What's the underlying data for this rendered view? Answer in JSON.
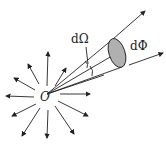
{
  "diagram": {
    "labels": {
      "source": "O",
      "solid_angle": "dΩ",
      "flux": "dΦ"
    },
    "colors": {
      "line": "#222222",
      "flux_fill": "#b0b0b0",
      "background": "#ffffff"
    }
  }
}
